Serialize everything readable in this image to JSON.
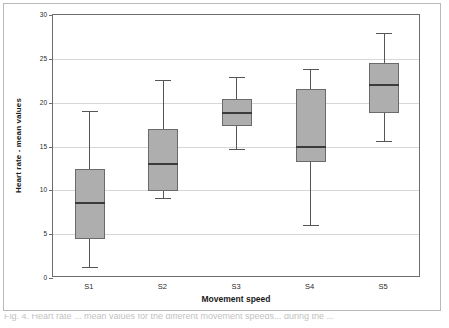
{
  "figure": {
    "caption_fragment": "Fig. 4. Heart rate ... mean values for the different movement speeds... during the ...",
    "frame_color": "#b9b9b9"
  },
  "chart_data": {
    "type": "box",
    "title": "",
    "xlabel": "Movement speed",
    "ylabel": "Heart rate - mean values",
    "categories": [
      "S1",
      "S2",
      "S3",
      "S4",
      "S5"
    ],
    "ylim": [
      0,
      30
    ],
    "yticks": [
      0,
      5,
      10,
      15,
      20,
      25,
      30
    ],
    "ytick_labels": [
      "0",
      "5",
      "10",
      "15",
      "20",
      "25",
      "30"
    ],
    "grid": true,
    "legend": "none",
    "box_fill": "#aeaeae",
    "box_edge": "#6a6a6a",
    "boxes": [
      {
        "category": "S1",
        "whisker_low": 1.3,
        "q1": 4.5,
        "median": 8.5,
        "q3": 12.4,
        "whisker_high": 19.0
      },
      {
        "category": "S2",
        "whisker_low": 9.1,
        "q1": 9.9,
        "median": 13.0,
        "q3": 17.0,
        "whisker_high": 22.6
      },
      {
        "category": "S3",
        "whisker_low": 14.7,
        "q1": 17.3,
        "median": 18.8,
        "q3": 20.4,
        "whisker_high": 22.9
      },
      {
        "category": "S4",
        "whisker_low": 6.1,
        "q1": 13.2,
        "median": 15.0,
        "q3": 21.6,
        "whisker_high": 23.8
      },
      {
        "category": "S5",
        "whisker_low": 15.6,
        "q1": 18.8,
        "median": 22.0,
        "q3": 24.5,
        "whisker_high": 27.9
      }
    ]
  }
}
